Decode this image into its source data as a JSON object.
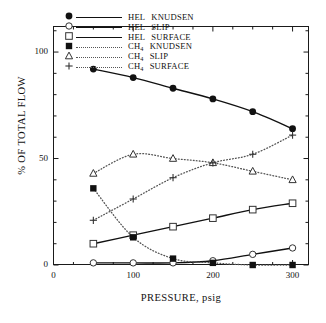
{
  "chart_data": {
    "type": "line",
    "title": "",
    "xlabel": "PRESSURE, psig",
    "ylabel": "% OF TOTAL FLOW",
    "x": [
      50,
      100,
      150,
      200,
      250,
      300
    ],
    "xlim": [
      0,
      320
    ],
    "ylim": [
      0,
      112
    ],
    "xticks": [
      0,
      100,
      200,
      300
    ],
    "yticks": [
      0,
      50,
      100
    ],
    "xminor_step": 25,
    "yminor_step": 10,
    "grid": false,
    "legend_position": "top-left-inside",
    "series": [
      {
        "name": "HEL KNUDSEN",
        "marker": "filled-circle",
        "line": "solid",
        "values": [
          92,
          88,
          83,
          78,
          72,
          64
        ]
      },
      {
        "name": "HEL SLIP",
        "marker": "open-circle",
        "line": "solid",
        "values": [
          1,
          1,
          1,
          2,
          5,
          8
        ]
      },
      {
        "name": "HEL SURFACE",
        "marker": "open-square",
        "line": "solid",
        "values": [
          10,
          14,
          18,
          22,
          26,
          29
        ]
      },
      {
        "name": "CH4 KNUDSEN",
        "marker": "filled-square",
        "line": "dotted",
        "values": [
          36,
          13,
          3,
          1,
          0,
          0
        ]
      },
      {
        "name": "CH4 SLIP",
        "marker": "open-triangle",
        "line": "dotted",
        "values": [
          43,
          52,
          50,
          48,
          44,
          40
        ]
      },
      {
        "name": "CH4 SURFACE",
        "marker": "plus",
        "line": "dotted",
        "values": [
          21,
          31,
          41,
          48,
          52,
          61
        ]
      }
    ]
  },
  "axes": {
    "y_label": "% OF TOTAL FLOW",
    "x_label": "PRESSURE, psig",
    "y_tick_labels": [
      "0",
      "50",
      "100"
    ],
    "x_tick_labels": [
      "0",
      "100",
      "200",
      "300"
    ]
  },
  "legend": {
    "entries": [
      {
        "label": "HEL KNUDSEN",
        "base": "HEL",
        "sub": "",
        "tail": "KNUDSEN",
        "symbol": "filled-circle",
        "line": "solid"
      },
      {
        "label": "HEL SLIP",
        "base": "HEL",
        "sub": "",
        "tail": "SLIP",
        "symbol": "open-circle",
        "line": "solid"
      },
      {
        "label": "HEL SURFACE",
        "base": "HEL",
        "sub": "",
        "tail": "SURFACE",
        "symbol": "open-square",
        "line": "solid"
      },
      {
        "label": "CH4 KNUDSEN",
        "base": "CH",
        "sub": "4",
        "tail": "KNUDSEN",
        "symbol": "filled-square",
        "line": "dotted"
      },
      {
        "label": "CH4 SLIP",
        "base": "CH",
        "sub": "4",
        "tail": "SLIP",
        "symbol": "open-triangle",
        "line": "dotted"
      },
      {
        "label": "CH4 SURFACE",
        "base": "CH",
        "sub": "4",
        "tail": "SURFACE",
        "symbol": "plus",
        "line": "dotted"
      }
    ]
  },
  "colors": {
    "axis": "#1a1a1a",
    "solid_line": "#111111",
    "dotted_line": "#555555",
    "background": "#ffffff"
  }
}
